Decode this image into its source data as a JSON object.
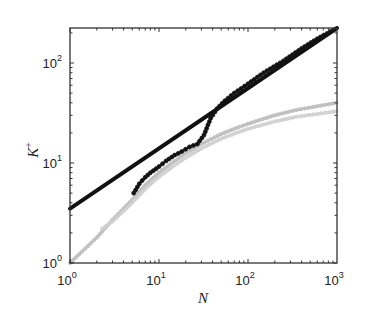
{
  "chart_data": {
    "type": "line",
    "title": "",
    "xlabel": "N",
    "ylabel": "K+",
    "xscale": "log",
    "yscale": "log",
    "xlim": [
      1,
      1000
    ],
    "ylim": [
      1,
      224
    ],
    "x_ticks": [
      {
        "value": 1,
        "base": "10",
        "exp": "0"
      },
      {
        "value": 10,
        "base": "10",
        "exp": "1"
      },
      {
        "value": 100,
        "base": "10",
        "exp": "2"
      },
      {
        "value": 1000,
        "base": "10",
        "exp": "3"
      }
    ],
    "y_ticks": [
      {
        "value": 1,
        "base": "10",
        "exp": "0"
      },
      {
        "value": 10,
        "base": "10",
        "exp": "1"
      },
      {
        "value": 100,
        "base": "10",
        "exp": "2"
      }
    ],
    "grid": false,
    "legend": null,
    "series": [
      {
        "name": "power-law fit",
        "color": "#111111",
        "style": "thick-solid",
        "x": [
          1,
          1000
        ],
        "y": [
          3.5,
          224
        ]
      },
      {
        "name": "dark data",
        "color": "#1a1a1a",
        "style": "dotted-markers",
        "x": [
          5.2,
          6,
          7,
          8,
          10,
          12,
          15,
          18,
          22,
          27,
          32,
          38,
          45,
          55,
          70,
          100,
          150,
          250,
          400,
          600,
          1000
        ],
        "y": [
          5,
          6.2,
          7.2,
          8,
          9.2,
          10.5,
          12,
          13,
          14.5,
          15.5,
          19,
          28,
          35,
          42,
          50,
          62,
          80,
          105,
          140,
          175,
          224
        ]
      },
      {
        "name": "light data 1",
        "color": "#bdbdbd",
        "style": "dotted-markers",
        "x": [
          1,
          2,
          3,
          5,
          7,
          10,
          15,
          20,
          30,
          50,
          80,
          120,
          200,
          350,
          600,
          1000
        ],
        "y": [
          1,
          1.8,
          2.7,
          4.3,
          6,
          8,
          10.5,
          12.5,
          15.5,
          19.5,
          23,
          26,
          30,
          34,
          37,
          40
        ]
      },
      {
        "name": "light data 2",
        "color": "#cfcfcf",
        "style": "dotted-markers",
        "x": [
          2.3,
          3,
          5,
          7,
          10,
          15,
          20,
          30,
          50,
          80,
          120,
          200,
          350,
          600,
          1000
        ],
        "y": [
          2.2,
          2.6,
          4.0,
          5.5,
          7.3,
          9.5,
          11.3,
          14,
          17.5,
          20.5,
          23,
          26,
          29,
          31,
          33
        ]
      }
    ]
  }
}
